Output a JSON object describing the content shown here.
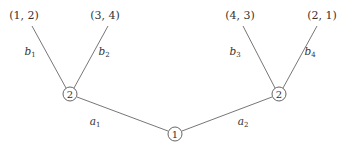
{
  "diagram": {
    "type": "game-tree",
    "root": {
      "id": "root",
      "label": "1",
      "cx": 175,
      "cy": 134
    },
    "players": [
      {
        "id": "left",
        "label": "2",
        "cx": 70,
        "cy": 94
      },
      {
        "id": "right",
        "label": "2",
        "cx": 279,
        "cy": 94
      }
    ],
    "edges": [
      {
        "id": "a1",
        "from": "root",
        "to": "left",
        "x1": 168,
        "y1": 131,
        "x2": 77,
        "y2": 97,
        "label": "a",
        "sub": "1",
        "lx": 95,
        "ly": 125
      },
      {
        "id": "a2",
        "from": "root",
        "to": "right",
        "x1": 182,
        "y1": 131,
        "x2": 272,
        "y2": 97,
        "label": "a",
        "sub": "2",
        "lx": 243,
        "ly": 125
      },
      {
        "id": "b1",
        "from": "left",
        "to": "leaf1",
        "x1": 66,
        "y1": 88,
        "x2": 32,
        "y2": 26,
        "label": "b",
        "sub": "1",
        "lx": 30,
        "ly": 55
      },
      {
        "id": "b2",
        "from": "left",
        "to": "leaf2",
        "x1": 74,
        "y1": 88,
        "x2": 108,
        "y2": 26,
        "label": "b",
        "sub": "2",
        "lx": 104,
        "ly": 55
      },
      {
        "id": "b3",
        "from": "right",
        "to": "leaf3",
        "x1": 275,
        "y1": 88,
        "x2": 243,
        "y2": 26,
        "label": "b",
        "sub": "3",
        "lx": 235,
        "ly": 55
      },
      {
        "id": "b4",
        "from": "right",
        "to": "leaf4",
        "x1": 283,
        "y1": 88,
        "x2": 317,
        "y2": 26,
        "label": "b",
        "sub": "4",
        "lx": 310,
        "ly": 55
      }
    ],
    "leaves": [
      {
        "id": "leaf1",
        "payoff": "(1, 2)",
        "x": 24,
        "y": 19
      },
      {
        "id": "leaf2",
        "payoff": "(3, 4)",
        "x": 105,
        "y": 19
      },
      {
        "id": "leaf3",
        "payoff": "(4, 3)",
        "x": 240,
        "y": 19
      },
      {
        "id": "leaf4",
        "payoff": "(2, 1)",
        "x": 322,
        "y": 19
      }
    ]
  }
}
